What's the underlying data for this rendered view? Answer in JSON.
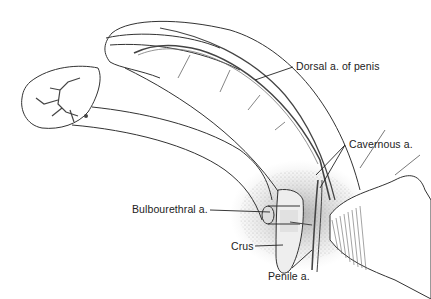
{
  "diagram": {
    "type": "anatomical-illustration",
    "labels": [
      {
        "id": "dorsal",
        "text": "Dorsal a. of penis"
      },
      {
        "id": "cavernous",
        "text": "Cavernous a."
      },
      {
        "id": "bulbourethral",
        "text": "Bulbourethral a."
      },
      {
        "id": "crus",
        "text": "Crus"
      },
      {
        "id": "penile",
        "text": "Penile a."
      }
    ]
  },
  "colors": {
    "line": "#333333",
    "artery": "#555555",
    "shade": "#bbbbbb",
    "background": "#ffffff"
  }
}
